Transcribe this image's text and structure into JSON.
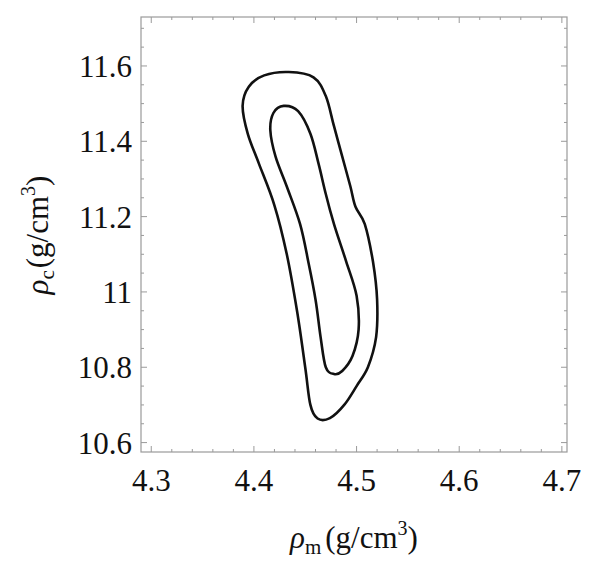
{
  "chart_data": {
    "type": "contour",
    "title": "",
    "xlabel": "ρm (g/cm³)",
    "ylabel": "ρc (g/cm³)",
    "xlabel_parts": {
      "symbol": "ρ",
      "subscript": "m",
      "unit": "(g/cm",
      "superscript": "3",
      "close": ")"
    },
    "ylabel_parts": {
      "symbol": "ρ",
      "subscript": "c",
      "unit": "(g/cm",
      "superscript": "3",
      "close": ")"
    },
    "xlim": [
      4.29,
      4.705
    ],
    "ylim": [
      10.575,
      11.73
    ],
    "x_ticks": [
      4.3,
      4.4,
      4.5,
      4.6,
      4.7
    ],
    "x_tick_labels": [
      "4.3",
      "4.4",
      "4.5",
      "4.6",
      "4.7"
    ],
    "y_ticks": [
      10.6,
      10.8,
      11.0,
      11.2,
      11.4,
      11.6
    ],
    "y_tick_labels": [
      "10.6",
      "10.8",
      "11",
      "11.2",
      "11.4",
      "11.6"
    ],
    "grid": false,
    "legend": null,
    "series": [
      {
        "name": "outer contour",
        "closed": true,
        "points": [
          [
            4.434,
            11.584
          ],
          [
            4.458,
            11.57
          ],
          [
            4.47,
            11.52
          ],
          [
            4.478,
            11.44
          ],
          [
            4.486,
            11.36
          ],
          [
            4.494,
            11.28
          ],
          [
            4.499,
            11.226
          ],
          [
            4.508,
            11.18
          ],
          [
            4.516,
            11.08
          ],
          [
            4.52,
            10.98
          ],
          [
            4.519,
            10.88
          ],
          [
            4.511,
            10.8
          ],
          [
            4.5,
            10.75
          ],
          [
            4.488,
            10.7
          ],
          [
            4.474,
            10.665
          ],
          [
            4.462,
            10.664
          ],
          [
            4.455,
            10.7
          ],
          [
            4.45,
            10.8
          ],
          [
            4.442,
            10.95
          ],
          [
            4.432,
            11.1
          ],
          [
            4.42,
            11.23
          ],
          [
            4.405,
            11.34
          ],
          [
            4.394,
            11.42
          ],
          [
            4.389,
            11.494
          ],
          [
            4.395,
            11.545
          ],
          [
            4.41,
            11.575
          ]
        ]
      },
      {
        "name": "inner contour",
        "closed": true,
        "points": [
          [
            4.429,
            11.494
          ],
          [
            4.443,
            11.48
          ],
          [
            4.455,
            11.42
          ],
          [
            4.463,
            11.34
          ],
          [
            4.47,
            11.26
          ],
          [
            4.478,
            11.18
          ],
          [
            4.49,
            11.08
          ],
          [
            4.5,
            10.99
          ],
          [
            4.502,
            10.9
          ],
          [
            4.496,
            10.83
          ],
          [
            4.486,
            10.79
          ],
          [
            4.478,
            10.782
          ],
          [
            4.47,
            10.8
          ],
          [
            4.465,
            10.88
          ],
          [
            4.46,
            10.98
          ],
          [
            4.453,
            11.08
          ],
          [
            4.445,
            11.18
          ],
          [
            4.432,
            11.28
          ],
          [
            4.421,
            11.36
          ],
          [
            4.416,
            11.43
          ],
          [
            4.419,
            11.475
          ]
        ]
      }
    ]
  }
}
